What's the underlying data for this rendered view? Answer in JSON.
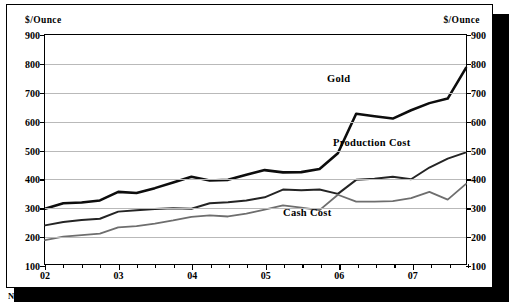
{
  "footnote": "Note: Production and Cash Cost From BMD",
  "axis_unit_left": "$/Ounce",
  "axis_unit_right": "$/Ounce",
  "labels": {
    "gold": "Gold",
    "production_cost": "Production Cost",
    "cash_cost": "Cash Cost"
  },
  "colors": {
    "gold_line": "#0d0d0d",
    "production_line": "#242424",
    "cash_line": "#6e6e6e",
    "grid": "#b9b9b9",
    "frame": "#000000",
    "shadow": "#000000",
    "background": "#ffffff"
  },
  "chart_data": {
    "type": "line",
    "title": "",
    "xlabel": "",
    "ylabel": "$/Ounce",
    "ylim": [
      100,
      900
    ],
    "yticks": [
      100,
      200,
      300,
      400,
      500,
      600,
      700,
      800,
      900
    ],
    "grid": true,
    "legend": "inline-annotations",
    "xlim": [
      2002.0,
      2007.75
    ],
    "xticks": [
      2002,
      2003,
      2004,
      2005,
      2006,
      2007
    ],
    "xtick_labels": [
      "02",
      "03",
      "04",
      "05",
      "06",
      "07"
    ],
    "x": [
      2002.0,
      2002.25,
      2002.5,
      2002.75,
      2003.0,
      2003.25,
      2003.5,
      2003.75,
      2004.0,
      2004.25,
      2004.5,
      2004.75,
      2005.0,
      2005.25,
      2005.5,
      2005.75,
      2006.0,
      2006.25,
      2006.5,
      2006.75,
      2007.0,
      2007.25,
      2007.5,
      2007.75
    ],
    "series": [
      {
        "name": "Gold",
        "values": [
          293,
          312,
          315,
          322,
          352,
          348,
          365,
          385,
          405,
          392,
          394,
          412,
          428,
          420,
          421,
          432,
          487,
          625,
          616,
          608,
          637,
          662,
          678,
          785
        ]
      },
      {
        "name": "Production Cost",
        "values": [
          235,
          247,
          254,
          258,
          283,
          288,
          292,
          295,
          293,
          312,
          316,
          322,
          333,
          360,
          358,
          360,
          345,
          394,
          398,
          405,
          396,
          437,
          468,
          490
        ]
      },
      {
        "name": "Cash Cost",
        "values": [
          183,
          196,
          201,
          206,
          228,
          232,
          241,
          252,
          265,
          270,
          266,
          276,
          290,
          305,
          297,
          288,
          342,
          318,
          318,
          320,
          330,
          352,
          325,
          380
        ]
      }
    ]
  }
}
